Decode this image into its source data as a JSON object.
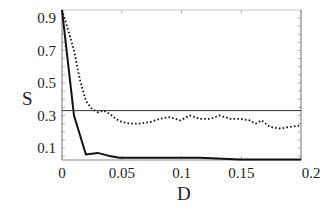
{
  "chart_data": {
    "type": "line",
    "title": "",
    "xlabel": "D",
    "ylabel": "S",
    "xlim": [
      0,
      0.2
    ],
    "ylim": [
      0.03,
      0.95
    ],
    "x_ticks": [
      "0",
      "0.05",
      "0.1",
      "0.15",
      "0.2"
    ],
    "y_ticks": [
      "0.9",
      "0.7",
      "0.5",
      "0.3",
      "0.1"
    ],
    "grid": false,
    "legend": null,
    "series": [
      {
        "name": "dotted",
        "style": "dotted",
        "x": [
          0,
          0.005,
          0.01,
          0.015,
          0.02,
          0.025,
          0.03,
          0.035,
          0.04,
          0.045,
          0.05,
          0.057,
          0.065,
          0.074,
          0.082,
          0.09,
          0.099,
          0.107,
          0.115,
          0.124,
          0.132,
          0.141,
          0.149,
          0.157,
          0.162,
          0.167,
          0.174,
          0.182,
          0.191,
          0.2
        ],
        "y": [
          0.95,
          0.83,
          0.7,
          0.52,
          0.39,
          0.34,
          0.32,
          0.33,
          0.31,
          0.28,
          0.26,
          0.25,
          0.25,
          0.26,
          0.28,
          0.29,
          0.27,
          0.3,
          0.28,
          0.28,
          0.3,
          0.28,
          0.28,
          0.27,
          0.25,
          0.27,
          0.23,
          0.22,
          0.23,
          0.24
        ]
      },
      {
        "name": "solid",
        "style": "solid",
        "x": [
          0,
          0.01,
          0.02,
          0.03,
          0.04,
          0.048,
          0.074,
          0.099,
          0.115,
          0.149,
          0.2
        ],
        "y": [
          0.95,
          0.3,
          0.06,
          0.07,
          0.05,
          0.04,
          0.04,
          0.04,
          0.04,
          0.03,
          0.03
        ]
      },
      {
        "name": "reference",
        "style": "solid-thin",
        "x": [
          0,
          0.2
        ],
        "y": [
          0.33,
          0.33
        ]
      }
    ]
  }
}
